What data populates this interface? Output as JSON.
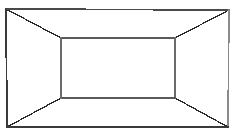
{
  "figure": {
    "title": "One-point perspective box interior",
    "background_color": "#ffffff",
    "canvas": {
      "width": 235,
      "height": 137
    },
    "stroke_colors": {
      "outer_dark": "#3a3a3a",
      "outer_light": "#8a8a8a",
      "inner": "#5a5a5a",
      "diagonal": "#2b2b2b"
    },
    "stroke_widths": {
      "outer": 1.6,
      "inner": 1.4,
      "diagonal": 1.3
    },
    "outer_rect": {
      "label": "outer-frame",
      "left": 6,
      "top": 9,
      "right": 229,
      "bottom": 127,
      "corners": {
        "top_left": [
          6,
          9
        ],
        "top_right": [
          229,
          10
        ],
        "bottom_right": [
          228,
          127
        ],
        "bottom_left": [
          7,
          127
        ]
      }
    },
    "inner_rect": {
      "label": "back-wall",
      "left": 61,
      "top": 38,
      "right": 175,
      "bottom": 98,
      "corners": {
        "top_left": [
          61,
          38
        ],
        "top_right": [
          175,
          38
        ],
        "bottom_right": [
          175,
          98
        ],
        "bottom_left": [
          61,
          98
        ]
      }
    },
    "diagonals": [
      {
        "name": "ceiling-left-edge",
        "from": [
          6,
          9
        ],
        "to": [
          61,
          38
        ]
      },
      {
        "name": "ceiling-right-edge",
        "from": [
          229,
          10
        ],
        "to": [
          175,
          38
        ]
      },
      {
        "name": "floor-right-edge",
        "from": [
          228,
          127
        ],
        "to": [
          175,
          98
        ]
      },
      {
        "name": "floor-left-edge",
        "from": [
          7,
          127
        ],
        "to": [
          61,
          98
        ]
      }
    ],
    "faces": [
      {
        "name": "back-wall-face"
      },
      {
        "name": "ceiling-face"
      },
      {
        "name": "floor-face"
      },
      {
        "name": "left-wall-face"
      },
      {
        "name": "right-wall-face"
      }
    ]
  }
}
